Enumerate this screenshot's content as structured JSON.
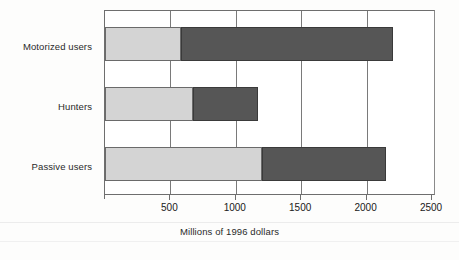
{
  "chart_data": {
    "type": "bar",
    "orientation": "horizontal",
    "stacked": true,
    "title": "",
    "xlabel": "Millions of 1996 dollars",
    "ylabel": "",
    "categories": [
      "Motorized users",
      "Hunters",
      "Passive users"
    ],
    "series": [
      {
        "name": "Segment 1",
        "color": "#d4d4d4",
        "values": [
          580,
          670,
          1200
        ]
      },
      {
        "name": "Segment 2",
        "color": "#565656",
        "values": [
          1620,
          500,
          950
        ]
      }
    ],
    "totals": [
      2200,
      1170,
      2150
    ],
    "xlim": [
      0,
      2500
    ],
    "xticks": [
      0,
      500,
      1000,
      1500,
      2000,
      2500
    ],
    "xtick_labels": [
      "",
      "500",
      "1000",
      "1500",
      "2000",
      "2500"
    ],
    "grid": "vertical",
    "legend": "none"
  },
  "axis": {
    "x_title": "Millions of 1996 dollars",
    "tick_labels": [
      "500",
      "1000",
      "1500",
      "2000",
      "2500"
    ]
  },
  "categories": [
    {
      "label": "Motorized users"
    },
    {
      "label": "Hunters"
    },
    {
      "label": "Passive users"
    }
  ],
  "colors": {
    "segment_light": "#d4d4d4",
    "segment_dark": "#565656",
    "axis": "#6e6e6e",
    "background": "#fdfdfc"
  }
}
